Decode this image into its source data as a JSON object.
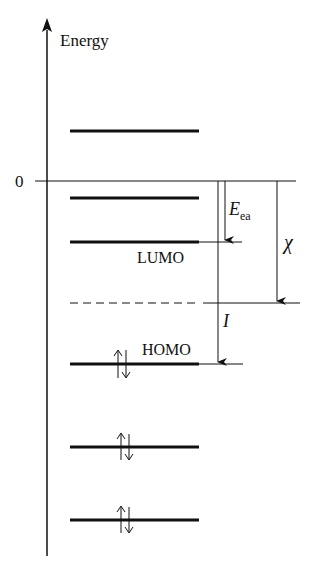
{
  "diagram": {
    "axis_label": "Energy",
    "zero_label": "0",
    "labels": {
      "lumo": "LUMO",
      "homo": "HOMO",
      "electron_affinity_symbol": "E",
      "electron_affinity_subscript": "ea",
      "ionization_symbol": "I",
      "electronegativity_symbol": "χ"
    },
    "levels": [
      {
        "name": "unoccupied-level-3",
        "y": 131,
        "occupied": false
      },
      {
        "name": "unoccupied-level-2",
        "y": 198,
        "occupied": false
      },
      {
        "name": "lumo",
        "y": 242,
        "occupied": false
      },
      {
        "name": "homo",
        "y": 364,
        "occupied": true
      },
      {
        "name": "occupied-level-2",
        "y": 447,
        "occupied": true
      },
      {
        "name": "occupied-level-3",
        "y": 520,
        "occupied": true
      }
    ],
    "midpoint_dashed_line_y": 303,
    "colors": {
      "line": "#111111",
      "background": "#ffffff"
    }
  }
}
